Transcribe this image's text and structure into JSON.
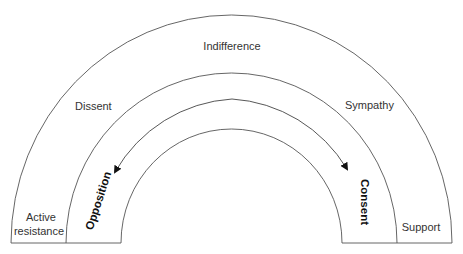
{
  "diagram": {
    "type": "semicircular spectrum",
    "outer_band": {
      "label_top": "Indifference",
      "label_left": "Active resistance",
      "label_right": "Support"
    },
    "middle_band": {
      "label_left": "Dissent",
      "label_right": "Sympathy"
    },
    "inner_band": {
      "label_left": "Opposition",
      "label_right": "Consent",
      "arrows": "bidirectional arc from center toward Opposition and toward Consent"
    },
    "colors": {
      "line": "#555555",
      "text": "#333333",
      "background": "#ffffff"
    }
  },
  "labels": {
    "indifference": "Indifference",
    "dissent": "Dissent",
    "sympathy": "Sympathy",
    "active_line1": "Active",
    "active_line2": "resistance",
    "support": "Support",
    "opposition": "Opposition",
    "consent": "Consent"
  }
}
